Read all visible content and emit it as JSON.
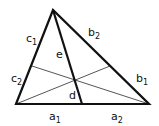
{
  "diagram": {
    "type": "triangle with cevians",
    "vertices": {
      "apex": [
        53,
        10
      ],
      "left": [
        16,
        104
      ],
      "right": [
        149,
        104
      ]
    },
    "cevians": [
      {
        "from": "apex",
        "to": [
          82,
          104
        ]
      },
      {
        "from": "left",
        "to": [
          110,
          66
        ]
      },
      {
        "from": "right",
        "to": [
          32,
          66
        ]
      }
    ],
    "labels": {
      "c1": {
        "base": "c",
        "sub": "1"
      },
      "c2": {
        "base": "c",
        "sub": "2"
      },
      "b1": {
        "base": "b",
        "sub": "1"
      },
      "b2": {
        "base": "b",
        "sub": "2"
      },
      "a1": {
        "base": "a",
        "sub": "1"
      },
      "a2": {
        "base": "a",
        "sub": "2"
      },
      "e": "e",
      "d": "d"
    },
    "colors": {
      "edge": "#111111",
      "cevian": "#444444"
    }
  }
}
